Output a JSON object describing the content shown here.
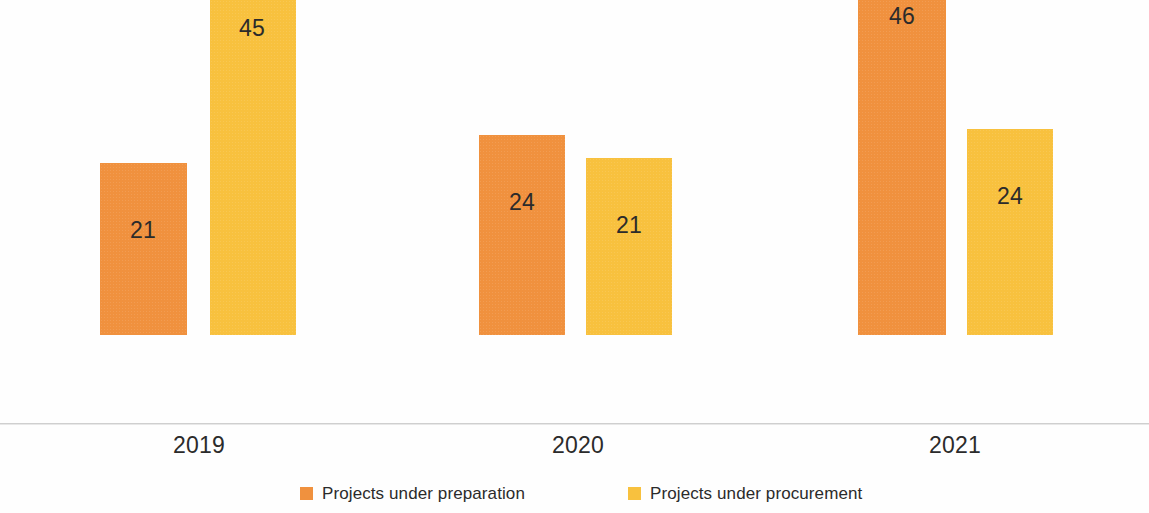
{
  "chart_data": {
    "type": "bar",
    "title": "",
    "subtitle": "",
    "xlabel": "",
    "ylabel": "",
    "categories": [
      "2019",
      "2020",
      "2021"
    ],
    "series": [
      {
        "name": "Projects under preparation",
        "color": "#f0913e",
        "values": [
          21,
          24,
          46
        ]
      },
      {
        "name": "Projects under procurement",
        "color": "#f8c13e",
        "values": [
          45,
          21,
          24
        ]
      }
    ],
    "ylim": [
      0,
      46
    ],
    "grid": false,
    "legend_position": "bottom",
    "data_labels_shown": true,
    "axis_color": "#cfcfcf",
    "background": "#ffffff"
  },
  "bars": [
    {
      "id": "2019-prep",
      "label": "21",
      "series": "Projects under preparation",
      "category": "2019",
      "value": 21,
      "left": 100,
      "width": 87,
      "height": 172,
      "color": "#f0913e",
      "label_center": 143,
      "label_top": 219
    },
    {
      "id": "2019-proc",
      "label": "45",
      "series": "Projects under procurement",
      "category": "2019",
      "value": 45,
      "left": 210,
      "width": 86,
      "height": 374,
      "color": "#f8c13e",
      "label_center": 252,
      "label_top": 17
    },
    {
      "id": "2020-prep",
      "label": "24",
      "series": "Projects under preparation",
      "category": "2020",
      "value": 24,
      "left": 479,
      "width": 86,
      "height": 200,
      "color": "#f0913e",
      "label_center": 522,
      "label_top": 191
    },
    {
      "id": "2020-proc",
      "label": "21",
      "series": "Projects under procurement",
      "category": "2020",
      "value": 21,
      "left": 586,
      "width": 86,
      "height": 177,
      "color": "#f8c13e",
      "label_center": 629,
      "label_top": 214
    },
    {
      "id": "2021-prep",
      "label": "46",
      "series": "Projects under preparation",
      "category": "2021",
      "value": 46,
      "left": 858,
      "width": 88,
      "height": 386,
      "color": "#f0913e",
      "label_center": 902,
      "label_top": 5
    },
    {
      "id": "2021-proc",
      "label": "24",
      "series": "Projects under procurement",
      "category": "2021",
      "value": 24,
      "left": 967,
      "width": 86,
      "height": 206,
      "color": "#f8c13e",
      "label_center": 1010,
      "label_top": 185
    }
  ],
  "category_labels": [
    {
      "text": "2019",
      "center": 199
    },
    {
      "text": "2020",
      "center": 578
    },
    {
      "text": "2021",
      "center": 955
    }
  ],
  "legend": {
    "items": [
      {
        "label": "Projects under preparation",
        "color": "#f0913e",
        "swatch": "square-swatch",
        "left": 300
      },
      {
        "label": "Projects under procurement",
        "color": "#f8c13e",
        "swatch": "square-swatch",
        "left": 628
      }
    ]
  }
}
